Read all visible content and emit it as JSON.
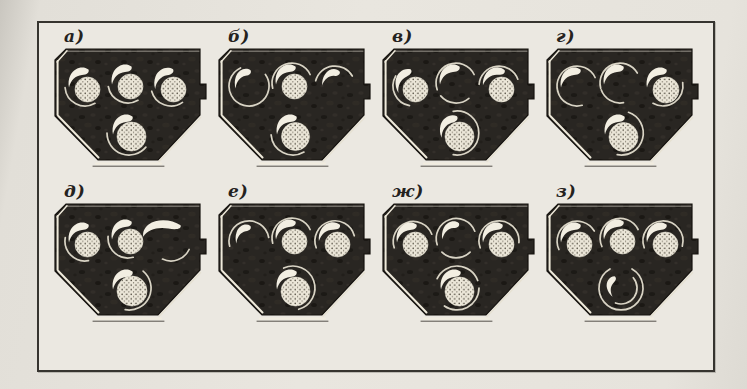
{
  "figure": {
    "kind": "scanned-book-figure",
    "description_of_graphic": "Eight variants of a multi-bore housing cross-section with screw rotors in different angular positions",
    "colors": {
      "paper": "#e9e6df",
      "frame_ink": "#36342f",
      "housing_dark": "#292622",
      "highlight": "#f0ebdd",
      "stipple_dot": "#453f33",
      "ring_line": "#d9d4c5"
    },
    "panels": [
      {
        "id": "a",
        "label": "а)",
        "rotors": [
          {
            "state": "full",
            "rot": 0,
            "ball": [
              2.5,
              3.5,
              12.5
            ],
            "arcs": [
              [
                150,
                265
              ]
            ]
          },
          {
            "state": "full",
            "rot": 0,
            "ball": [
              2.5,
              3.5,
              12.5
            ],
            "arcs": [
              [
                150,
                260
              ]
            ]
          },
          {
            "state": "full",
            "rot": -5,
            "ball": [
              2.5,
              3.5,
              12.5
            ],
            "arcs": [
              [
                145,
                255
              ]
            ]
          },
          {
            "state": "full",
            "rot": 0,
            "ball": [
              2.5,
              3.5,
              14.5
            ],
            "arcs": [
              [
                130,
                270
              ]
            ]
          }
        ]
      },
      {
        "id": "b",
        "label": "б)",
        "rotors": [
          {
            "state": "hollow",
            "rot": -5,
            "scale": [
              0.85,
              0.95
            ],
            "arcs": [
              [
                55,
                335
              ]
            ]
          },
          {
            "state": "full",
            "rot": 0,
            "ball": [
              2.5,
              3.5,
              12.5
            ],
            "arcs": [
              [
                255,
                425
              ]
            ]
          },
          {
            "state": "hollow",
            "rot": 8,
            "scale": [
              0.8,
              0.9
            ],
            "arcs": [
              [
                285,
                420
              ]
            ]
          },
          {
            "state": "full",
            "rot": 0,
            "ball": [
              2.5,
              3.5,
              14
            ],
            "arcs": [
              [
                150,
                265
              ]
            ]
          }
        ]
      },
      {
        "id": "v",
        "label": "в)",
        "rotors": [
          {
            "state": "full",
            "rot": -20,
            "ball": [
              2.5,
              3.5,
              12.5
            ],
            "arcs": [
              [
                190,
                300
              ]
            ]
          },
          {
            "state": "hollow",
            "rot": 0,
            "arcs": [
              [
                250,
                425
              ],
              [
                140,
                230
              ]
            ]
          },
          {
            "state": "full",
            "rot": 8,
            "ball": [
              2.5,
              3.5,
              12.5
            ],
            "arcs": [
              [
                275,
                430
              ]
            ]
          },
          {
            "state": "full",
            "rot": -12,
            "ball": [
              2.5,
              3.5,
              14.5
            ],
            "arcs": [
              [
                350,
                190
              ]
            ]
          }
        ]
      },
      {
        "id": "g",
        "label": "г)",
        "rotors": [
          {
            "state": "hollow",
            "rot": 0,
            "arcs": [
              [
                255,
                425
              ],
              [
                165,
                255
              ]
            ]
          },
          {
            "state": "hollow",
            "rot": 0,
            "arcs": [
              [
                255,
                420
              ],
              [
                170,
                250
              ]
            ]
          },
          {
            "state": "full",
            "rot": 0,
            "ball": [
              3,
              4,
              13
            ],
            "arcs": [
              [
                80,
                210
              ]
            ]
          },
          {
            "state": "full",
            "rot": 0,
            "ball": [
              2.5,
              4,
              14.5
            ],
            "arcs": [
              [
                20,
                190
              ]
            ]
          }
        ]
      },
      {
        "id": "d",
        "label": "д)",
        "rotors": [
          {
            "state": "full",
            "rot": 0,
            "ball": [
              2.5,
              3.5,
              12.5
            ],
            "arcs": [
              [
                170,
                280
              ]
            ]
          },
          {
            "state": "full",
            "rot": 0,
            "ball": [
              2.5,
              3.5,
              12.5
            ],
            "arcs": [
              [
                165,
                275
              ]
            ]
          },
          {
            "state": "hollow",
            "rot": 12,
            "scale": [
              1.75,
              1.05
            ],
            "arcs": [
              [
                115,
                205
              ]
            ]
          },
          {
            "state": "full",
            "rot": 0,
            "ball": [
              3,
              3,
              15
            ],
            "arcs": [
              [
                40,
                190
              ]
            ]
          }
        ]
      },
      {
        "id": "e",
        "label": "е)",
        "rotors": [
          {
            "state": "hollow",
            "rot": -5,
            "scale": [
              0.8,
              0.9
            ],
            "arcs": [
              [
                255,
                440
              ]
            ]
          },
          {
            "state": "full",
            "rot": 0,
            "ball": [
              2.5,
              3.5,
              12.5
            ],
            "arcs": [
              [
                255,
                425
              ]
            ]
          },
          {
            "state": "full",
            "rot": 5,
            "ball": [
              2.5,
              3.5,
              12.5
            ],
            "arcs": [
              [
                250,
                435
              ]
            ]
          },
          {
            "state": "full",
            "rot": 0,
            "ball": [
              2.5,
              3.5,
              14.5
            ],
            "arcs": [
              [
                335,
                165
              ]
            ]
          }
        ]
      },
      {
        "id": "zh",
        "label": "ж)",
        "rotors": [
          {
            "state": "full",
            "rot": 0,
            "ball": [
              2.5,
              3.5,
              12.5
            ],
            "arcs": [
              [
                250,
                430
              ]
            ]
          },
          {
            "state": "hollow",
            "rot": 0,
            "scale": [
              0.85,
              0.9
            ],
            "arcs": [
              [
                250,
                430
              ],
              [
                135,
                225
              ]
            ]
          },
          {
            "state": "full",
            "rot": 0,
            "ball": [
              2.5,
              3.5,
              12.5
            ],
            "arcs": [
              [
                250,
                455
              ]
            ]
          },
          {
            "state": "full",
            "rot": 0,
            "ball": [
              2.5,
              3.5,
              14.5
            ],
            "arcs": [
              [
                295,
                430
              ],
              [
                90,
                215
              ]
            ]
          }
        ]
      },
      {
        "id": "z",
        "label": "з)",
        "rotors": [
          {
            "state": "full",
            "rot": 0,
            "ball": [
              2.5,
              3.5,
              12.5
            ],
            "arcs": [
              [
                245,
                420
              ]
            ]
          },
          {
            "state": "full",
            "rot": 0,
            "ball": [
              2.5,
              3.5,
              12.5
            ],
            "arcs": [
              [
                245,
                425
              ]
            ]
          },
          {
            "state": "full",
            "rot": 0,
            "ball": [
              2.5,
              3.5,
              12.5
            ],
            "arcs": [
              [
                250,
                465
              ]
            ]
          },
          {
            "state": "hollow",
            "rot": -40,
            "scale": [
              0.75,
              0.8
            ],
            "arcs": [
              [
                30,
                330
              ],
              [
                50,
                200,
                -6
              ]
            ]
          }
        ]
      }
    ]
  }
}
